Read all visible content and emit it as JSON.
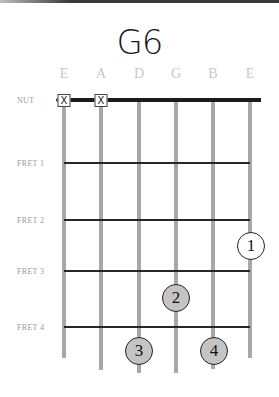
{
  "chord": {
    "name": "G6"
  },
  "strings": [
    {
      "label": "E",
      "x": 64,
      "bottom": 358,
      "muted": true
    },
    {
      "label": "A",
      "x": 101,
      "bottom": 370,
      "muted": true
    },
    {
      "label": "D",
      "x": 139,
      "bottom": 373,
      "muted": false
    },
    {
      "label": "G",
      "x": 176,
      "bottom": 373,
      "muted": false
    },
    {
      "label": "B",
      "x": 213,
      "bottom": 369,
      "muted": false
    },
    {
      "label": "E",
      "x": 250,
      "bottom": 358,
      "muted": false
    }
  ],
  "nut": {
    "label": "NUT"
  },
  "mute_symbol": "X",
  "frets": [
    {
      "label": "FRET 1",
      "y": 163
    },
    {
      "label": "FRET 2",
      "y": 220
    },
    {
      "label": "FRET 3",
      "y": 271
    },
    {
      "label": "FRET 4",
      "y": 327
    }
  ],
  "fingers": [
    {
      "number": "1",
      "string": 6,
      "x": 251,
      "y": 246,
      "style": "open"
    },
    {
      "number": "2",
      "string": 4,
      "x": 176,
      "y": 298,
      "style": "filled"
    },
    {
      "number": "3",
      "string": 3,
      "x": 139,
      "y": 351,
      "style": "filled"
    },
    {
      "number": "4",
      "string": 5,
      "x": 214,
      "y": 351,
      "style": "filled"
    }
  ]
}
